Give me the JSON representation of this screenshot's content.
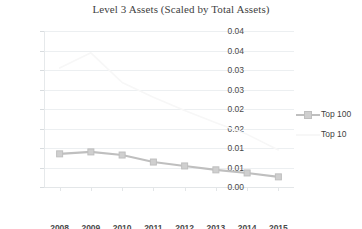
{
  "chart_data": {
    "type": "line",
    "title": "Level 3 Assets (Scaled by Total Assets)",
    "xlabel": "",
    "ylabel": "",
    "categories": [
      "2008",
      "2009",
      "2010",
      "2011",
      "2012",
      "2013",
      "2014",
      "2015"
    ],
    "x": [
      2008,
      2009,
      2010,
      2011,
      2012,
      2013,
      2014,
      2015
    ],
    "ylim": [
      0.0,
      0.04
    ],
    "ytick_values": [
      0.04,
      0.035,
      0.03,
      0.025,
      0.02,
      0.015,
      0.01,
      0.005,
      0.0
    ],
    "ytick_labels": [
      "0.04",
      "0.04",
      "0.03",
      "0.03",
      "0.02",
      "0.02",
      "0.01",
      "0.01",
      "0.00"
    ],
    "grid": true,
    "legend_position": "right",
    "series": [
      {
        "name": "Top 100",
        "color": "#bfbfbf",
        "marker": "square",
        "values": [
          0.0085,
          0.009,
          0.0082,
          0.0064,
          0.0054,
          0.0044,
          0.0036,
          0.0026
        ]
      },
      {
        "name": "Top 10",
        "color": "#f7f7f7",
        "marker": "none",
        "values": [
          0.0305,
          0.0344,
          0.0268,
          0.023,
          0.0196,
          0.0165,
          0.0135,
          0.0095
        ]
      }
    ]
  },
  "legend": {
    "items": [
      {
        "label": "Top 100",
        "color": "#bfbfbf",
        "marker": "square"
      },
      {
        "label": "Top 10",
        "color": "#f7f7f7",
        "marker": "none"
      }
    ]
  }
}
